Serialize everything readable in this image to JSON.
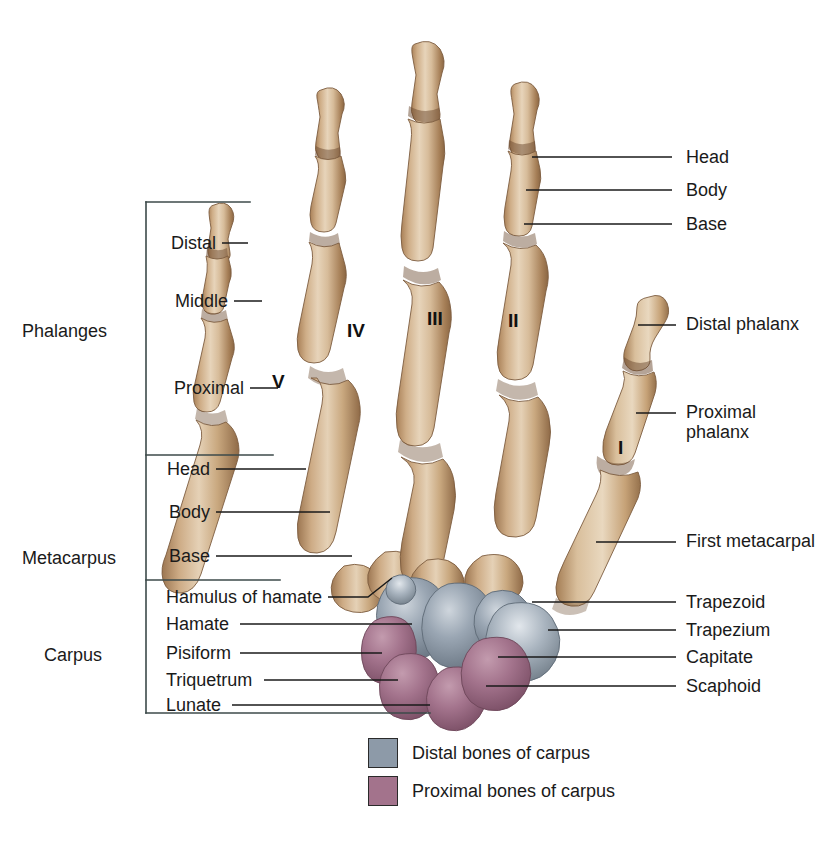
{
  "figure": {
    "width": 818,
    "height": 859
  },
  "colors": {
    "bone_light": "#e3cdad",
    "bone_mid": "#cdab85",
    "bone_shadow": "#9e7b58",
    "bone_dark": "#7d5c3f",
    "distal_carpus": "#8d9aa8",
    "distal_carpus_light": "#c3cbd3",
    "distal_carpus_dark": "#6a7683",
    "proximal_carpus": "#a3738c",
    "proximal_carpus_light": "#bd93a8",
    "proximal_carpus_dark": "#7d5268",
    "leader_line": "#1a1a1a",
    "bracket_line": "#3c4a4a",
    "text": "#1a1a1a",
    "background": "#ffffff"
  },
  "group_labels": [
    {
      "name": "phalanges",
      "text": "Phalanges",
      "x": 22,
      "y": 321
    },
    {
      "name": "metacarpus",
      "text": "Metacarpus",
      "x": 22,
      "y": 548
    },
    {
      "name": "carpus",
      "text": "Carpus",
      "x": 44,
      "y": 645
    }
  ],
  "left_labels": [
    {
      "name": "distal-phalanx",
      "text": "Distal",
      "x": 166,
      "y": 243,
      "line_x1": 222,
      "line_x2": 248,
      "line_y": 243
    },
    {
      "name": "middle-phalanx",
      "text": "Middle",
      "x": 166,
      "y": 301,
      "line_x1": 234,
      "line_x2": 262,
      "line_y": 301
    },
    {
      "name": "proximal-phalanx",
      "text": "Proximal",
      "x": 166,
      "y": 388,
      "line_x1": 250,
      "line_x2": 278,
      "line_y": 388
    },
    {
      "name": "metacarpal-head",
      "text": "Head",
      "x": 166,
      "y": 469,
      "line_x1": 216,
      "line_x2": 306,
      "line_y": 469
    },
    {
      "name": "metacarpal-body",
      "text": "Body",
      "x": 166,
      "y": 512,
      "line_x1": 216,
      "line_x2": 330,
      "line_y": 512
    },
    {
      "name": "metacarpal-base",
      "text": "Base",
      "x": 166,
      "y": 556,
      "line_x1": 216,
      "line_x2": 352,
      "line_y": 556
    },
    {
      "name": "hamulus-of-hamate",
      "text": "Hamulus of hamate",
      "x": 166,
      "y": 597,
      "line_x1": 328,
      "line_x2": 392,
      "line_y": 597
    },
    {
      "name": "hamate",
      "text": "Hamate",
      "x": 166,
      "y": 624,
      "line_x1": 240,
      "line_x2": 412,
      "line_y": 624
    },
    {
      "name": "pisiform",
      "text": "Pisiform",
      "x": 166,
      "y": 653,
      "line_x1": 240,
      "line_x2": 382,
      "line_y": 653
    },
    {
      "name": "triquetrum",
      "text": "Triquetrum",
      "x": 166,
      "y": 680,
      "line_x1": 264,
      "line_x2": 398,
      "line_y": 680
    },
    {
      "name": "lunate",
      "text": "Lunate",
      "x": 166,
      "y": 705,
      "line_x1": 232,
      "line_x2": 430,
      "line_y": 705
    }
  ],
  "right_labels": [
    {
      "name": "phalanx-head",
      "text": "Head",
      "x": 686,
      "y": 157,
      "line_x1": 532,
      "line_x2": 672,
      "line_y": 157
    },
    {
      "name": "phalanx-body",
      "text": "Body",
      "x": 686,
      "y": 190,
      "line_x1": 526,
      "line_x2": 672,
      "line_y": 190
    },
    {
      "name": "phalanx-base",
      "text": "Base",
      "x": 686,
      "y": 224,
      "line_x1": 524,
      "line_x2": 672,
      "line_y": 224
    },
    {
      "name": "thumb-distal-phalanx",
      "text": "Distal phalanx",
      "x": 686,
      "y": 324,
      "line_x1": 638,
      "line_x2": 676,
      "line_y": 325,
      "wrap": true
    },
    {
      "name": "thumb-proximal-phalanx",
      "text": "Proximal phalanx",
      "x": 686,
      "y": 412,
      "line_x1": 636,
      "line_x2": 676,
      "line_y": 413,
      "wrap": true
    },
    {
      "name": "first-metacarpal",
      "text": "First metacarpal",
      "x": 686,
      "y": 541,
      "line_x1": 596,
      "line_x2": 676,
      "line_y": 542,
      "wrap": true
    },
    {
      "name": "trapezoid",
      "text": "Trapezoid",
      "x": 686,
      "y": 602,
      "line_x1": 532,
      "line_x2": 676,
      "line_y": 602
    },
    {
      "name": "trapezium",
      "text": "Trapezium",
      "x": 686,
      "y": 630,
      "line_x1": 548,
      "line_x2": 676,
      "line_y": 630
    },
    {
      "name": "capitate",
      "text": "Capitate",
      "x": 686,
      "y": 657,
      "line_x1": 498,
      "line_x2": 676,
      "line_y": 657
    },
    {
      "name": "scaphoid",
      "text": "Scaphoid",
      "x": 686,
      "y": 686,
      "line_x1": 486,
      "line_x2": 676,
      "line_y": 686
    }
  ],
  "digit_numerals": [
    {
      "name": "digit-v",
      "text": "V",
      "x": 272,
      "y": 381
    },
    {
      "name": "digit-iv",
      "text": "IV",
      "x": 347,
      "y": 330
    },
    {
      "name": "digit-iii",
      "text": "III",
      "x": 427,
      "y": 318
    },
    {
      "name": "digit-ii",
      "text": "II",
      "x": 508,
      "y": 320
    },
    {
      "name": "digit-i",
      "text": "I",
      "x": 618,
      "y": 447
    }
  ],
  "bracket": {
    "x": 146,
    "top_y": 202,
    "bottom_y": 713,
    "top_width": 104,
    "bottom_width": 284,
    "dividers": [
      {
        "name": "phalanges-metacarpus-divider",
        "y": 455,
        "width": 127
      },
      {
        "name": "metacarpus-carpus-divider",
        "y": 580,
        "width": 134
      }
    ]
  },
  "legend": [
    {
      "name": "legend-distal-carpus",
      "label": "Distal bones of carpus",
      "color": "#8d9aa8",
      "x": 368,
      "y": 738
    },
    {
      "name": "legend-proximal-carpus",
      "label": "Proximal bones of carpus",
      "color": "#a3738c",
      "x": 368,
      "y": 776
    }
  ]
}
